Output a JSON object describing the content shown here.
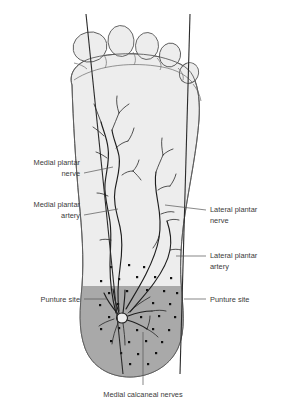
{
  "figure": {
    "type": "anatomical-illustration",
    "background_color": "#ffffff",
    "text_color": "#3a3a3a",
    "colors": {
      "foot_fill": "#ededed",
      "foot_outline": "#5a5a5a",
      "heel_shade": "#a9a9a9",
      "vessel": "#1e1e1e",
      "leader_line": "#555555",
      "reference_line": "#2a2a2a"
    }
  },
  "labels": {
    "medial_plantar_nerve": {
      "line1": "Medial plantar",
      "line2": "nerve"
    },
    "medial_plantar_artery": {
      "line1": "Medial plantar",
      "line2": "artery"
    },
    "lateral_plantar_nerve": {
      "line1": "Lateral plantar",
      "line2": "nerve"
    },
    "lateral_plantar_artery": {
      "line1": "Lateral plantar",
      "line2": "artery"
    },
    "puncture_site_left": "Punture site",
    "puncture_site_right": "Punture site",
    "medial_calcaneal_nerves": "Medial calcaneal nerves"
  }
}
